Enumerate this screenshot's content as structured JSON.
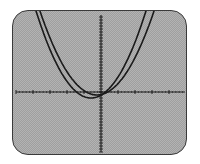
{
  "chart_data": {
    "type": "line",
    "title": "",
    "xlabel": "",
    "ylabel": "",
    "grid": false,
    "legend": null,
    "xlim": [
      -5,
      5
    ],
    "ylim": [
      -2.5,
      2.5
    ],
    "axes": {
      "origin_px": [
        100,
        91
      ],
      "x_major_tick_spacing_px": 17,
      "y_minor_tick_spacing_px": 3
    },
    "series": [
      {
        "name": "parabola-1",
        "vertex_px": [
          90,
          97
        ],
        "top_crossings_px": [
          [
            36,
            13
          ],
          [
            144,
            13
          ]
        ],
        "stroke": "#1a1a1a"
      },
      {
        "name": "parabola-2",
        "vertex_px": [
          98,
          94
        ],
        "top_crossings_px": [
          [
            40,
            13
          ],
          [
            152,
            13
          ]
        ],
        "stroke": "#1a1a1a"
      }
    ]
  },
  "screen": {
    "background": "#b3b3b3",
    "axis_color": "#222222"
  }
}
